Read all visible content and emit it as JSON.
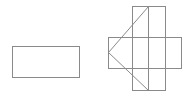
{
  "diagram": {
    "figures": [
      {
        "name": "standalone-rectangle",
        "kind": "rectangle"
      },
      {
        "name": "cross-figure",
        "kind": "composite",
        "parts": [
          "vertical-rectangle",
          "horizontal-rectangle",
          "center-vertical-line",
          "arrowhead-diagonals"
        ]
      }
    ],
    "stroke_color": "#8a8a8a",
    "background_color": "#ffffff"
  }
}
